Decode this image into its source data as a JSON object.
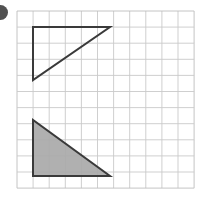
{
  "page": {
    "background_color": "#ffffff",
    "width": 207,
    "height": 209,
    "item_marker_label": "",
    "item_marker_color": "#2b2b2b"
  },
  "grid": {
    "name": "square-grid",
    "origin_x": 17,
    "origin_y": 11,
    "cell_size": 16.1,
    "columns": 11,
    "rows": 11,
    "line_color": "#c9c9c9",
    "line_width": 0.9,
    "border_color": "#bdbdbd"
  },
  "figures": [
    {
      "id": "triangle-outline",
      "label": "unshaded right triangle",
      "fill": "none",
      "fill_label": "white / unfilled",
      "stroke": "#3a3a3a",
      "stroke_width": 2,
      "right_angle_corner": "top-left",
      "points_px": [
        [
          33,
          27
        ],
        [
          110,
          27
        ],
        [
          33,
          80
        ]
      ],
      "points_grid": [
        [
          1,
          1
        ],
        [
          5.8,
          1
        ],
        [
          1,
          4.3
        ]
      ],
      "base_cells": 4.8,
      "height_cells": 3.3
    },
    {
      "id": "triangle-shaded",
      "label": "shaded right triangle",
      "fill": "#a9a9a9",
      "fill_label": "gray shaded",
      "stroke": "#3a3a3a",
      "stroke_width": 2,
      "right_angle_corner": "bottom-left",
      "points_px": [
        [
          33,
          120
        ],
        [
          33,
          176
        ],
        [
          110,
          176
        ]
      ],
      "points_grid": [
        [
          1,
          6.8
        ],
        [
          1,
          10.2
        ],
        [
          5.8,
          10.2
        ]
      ],
      "base_cells": 4.8,
      "height_cells": 3.5
    }
  ]
}
